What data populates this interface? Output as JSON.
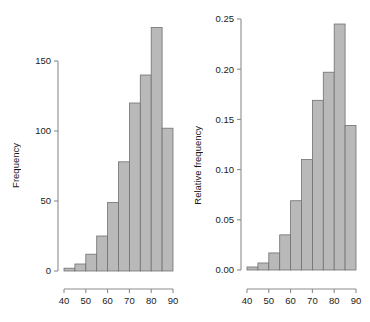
{
  "figure": {
    "background": "#ffffff",
    "bar_fill": "#b9b9b9",
    "bar_stroke": "#707070",
    "axis_color": "#8c8c8c",
    "text_color": "#1a1a1a"
  },
  "panels": [
    {
      "id": "frequency-histogram",
      "ylabel": "Frequency",
      "xlabel": "",
      "ytick_labels": [
        "0",
        "50",
        "100",
        "150"
      ],
      "ytick_values": [
        0,
        50,
        100,
        150
      ],
      "xtick_labels": [
        "40",
        "50",
        "60",
        "70",
        "80",
        "90"
      ],
      "xtick_values": [
        40,
        50,
        60,
        70,
        80,
        90
      ]
    },
    {
      "id": "relative-frequency-histogram",
      "ylabel": "Relative frequency",
      "xlabel": "",
      "ytick_labels": [
        "0.00",
        "0.05",
        "0.10",
        "0.15",
        "0.20",
        "0.25"
      ],
      "ytick_values": [
        0.0,
        0.05,
        0.1,
        0.15,
        0.2,
        0.25
      ],
      "xtick_labels": [
        "40",
        "50",
        "60",
        "70",
        "80",
        "90"
      ],
      "xtick_values": [
        40,
        50,
        60,
        70,
        80,
        90
      ]
    }
  ],
  "chart_data": [
    {
      "type": "bar",
      "subtype": "histogram",
      "title": "",
      "xlabel": "",
      "ylabel": "Frequency",
      "bin_width": 5,
      "bin_edges": [
        40,
        45,
        50,
        55,
        60,
        65,
        70,
        75,
        80,
        85,
        90
      ],
      "categories": [
        "40-45",
        "45-50",
        "50-55",
        "55-60",
        "60-65",
        "65-70",
        "70-75",
        "75-80",
        "80-85",
        "85-90"
      ],
      "values": [
        2,
        5,
        12,
        25,
        49,
        78,
        120,
        140,
        174,
        102
      ],
      "xlim": [
        38,
        92
      ],
      "ylim": [
        0,
        178
      ],
      "grid": false,
      "legend": false
    },
    {
      "type": "bar",
      "subtype": "histogram",
      "title": "",
      "xlabel": "",
      "ylabel": "Relative frequency",
      "bin_width": 5,
      "bin_edges": [
        40,
        45,
        50,
        55,
        60,
        65,
        70,
        75,
        80,
        85,
        90
      ],
      "categories": [
        "40-45",
        "45-50",
        "50-55",
        "55-60",
        "60-65",
        "65-70",
        "70-75",
        "75-80",
        "80-85",
        "85-90"
      ],
      "values": [
        0.003,
        0.007,
        0.017,
        0.035,
        0.069,
        0.11,
        0.169,
        0.197,
        0.245,
        0.144
      ],
      "xlim": [
        38,
        92
      ],
      "ylim": [
        0,
        0.251
      ],
      "grid": false,
      "legend": false
    }
  ]
}
